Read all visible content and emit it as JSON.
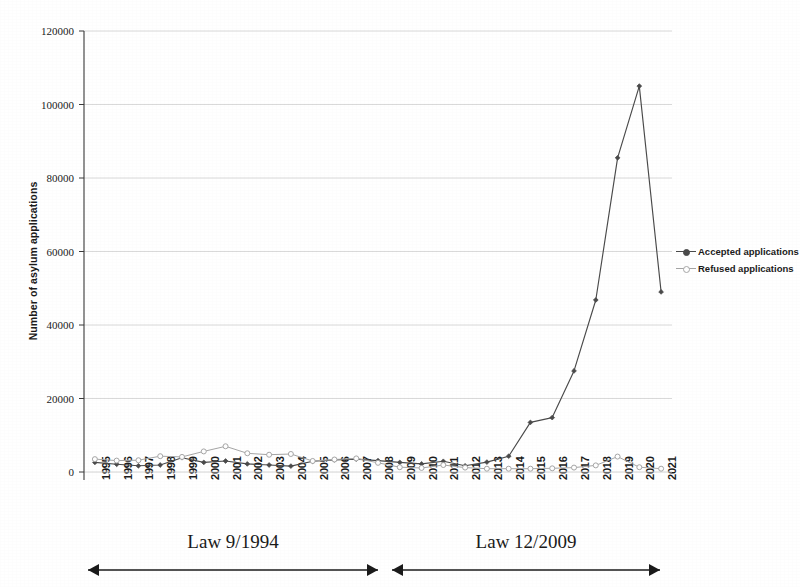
{
  "chart_data": {
    "type": "line",
    "title": "",
    "xlabel": "",
    "ylabel": "Number of asylum applications",
    "ylim": [
      0,
      120000
    ],
    "ytick_labels": [
      "0",
      "20000",
      "40000",
      "60000",
      "80000",
      "100000",
      "120000"
    ],
    "yticks": [
      0,
      20000,
      40000,
      60000,
      80000,
      100000,
      120000
    ],
    "grid": true,
    "legend_position": "right",
    "categories": [
      "1995",
      "1996",
      "1997",
      "1998",
      "1999",
      "2000",
      "2001",
      "2002",
      "2003",
      "2004",
      "2005",
      "2006",
      "2007",
      "2008",
      "2009",
      "2010",
      "2011",
      "2012",
      "2013",
      "2014",
      "2015",
      "2016",
      "2017",
      "2018",
      "2019",
      "2020",
      "2021"
    ],
    "series": [
      {
        "name": "Accepted applications",
        "color": "#4a4a4a",
        "marker": "diamond",
        "values": [
          2600,
          2100,
          1700,
          1900,
          3900,
          2600,
          3000,
          2200,
          1900,
          1600,
          2900,
          3300,
          3500,
          3100,
          2600,
          2200,
          2900,
          1700,
          2700,
          4300,
          13500,
          14800,
          27500,
          46800,
          85500,
          105000,
          49000
        ]
      },
      {
        "name": "Refused applications",
        "color": "#a6a6a6",
        "marker": "circle",
        "values": [
          3500,
          3100,
          3200,
          4300,
          4100,
          5600,
          7000,
          5100,
          4700,
          4900,
          3000,
          3400,
          3700,
          2500,
          1300,
          1100,
          1900,
          1200,
          900,
          900,
          900,
          1000,
          1200,
          1800,
          4200,
          1300,
          900
        ]
      }
    ]
  },
  "annotations": {
    "law_left": "Law 9/1994",
    "law_right": "Law 12/2009"
  }
}
